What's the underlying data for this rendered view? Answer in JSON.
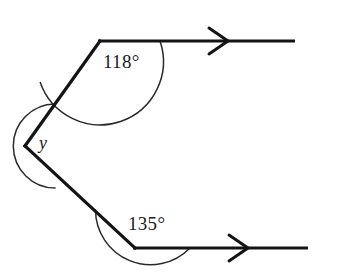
{
  "figure": {
    "type": "geometry-diagram",
    "background_color": "#ffffff",
    "stroke_color": "#141414",
    "arc_color": "#2a2a2a",
    "text_color": "#1a1a1a"
  },
  "labels": {
    "top_angle": "118°",
    "left_angle": "y",
    "bottom_angle": "135°"
  },
  "geometry": {
    "vertices": {
      "top": {
        "x": 100,
        "y": 41
      },
      "left": {
        "x": 25,
        "y": 146
      },
      "bottom": {
        "x": 135,
        "y": 248
      }
    },
    "rays": [
      {
        "name": "top-ray",
        "from": {
          "x": 100,
          "y": 41
        },
        "to": {
          "x": 295,
          "y": 41
        },
        "arrow_tip_x": 228,
        "direction": "right"
      },
      {
        "name": "bottom-ray",
        "from": {
          "x": 135,
          "y": 248
        },
        "to": {
          "x": 308,
          "y": 248
        },
        "arrow_tip_x": 248,
        "direction": "right"
      }
    ],
    "segments": [
      {
        "name": "upper-left-side",
        "from": {
          "x": 100,
          "y": 41
        },
        "to": {
          "x": 25,
          "y": 146
        }
      },
      {
        "name": "lower-left-side",
        "from": {
          "x": 25,
          "y": 146
        },
        "to": {
          "x": 135,
          "y": 248
        }
      }
    ],
    "arcs": [
      {
        "name": "top-angle-arc",
        "center": {
          "x": 100,
          "y": 41
        },
        "radius": 60,
        "value": "118°"
      },
      {
        "name": "left-angle-arc",
        "center": {
          "x": 25,
          "y": 146
        },
        "radius": 42,
        "value": "y"
      },
      {
        "name": "bottom-angle-arc",
        "center": {
          "x": 135,
          "y": 248
        },
        "radius": 55,
        "value": "135°"
      }
    ],
    "label_positions": {
      "top_angle": {
        "x": 103,
        "y": 68
      },
      "left_angle": {
        "x": 39,
        "y": 149
      },
      "bottom_angle": {
        "x": 128,
        "y": 230
      }
    }
  }
}
